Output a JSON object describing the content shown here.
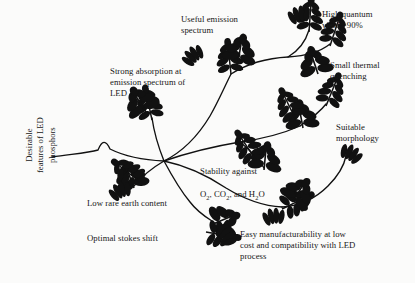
{
  "figure": {
    "title": "Desirable features of LED phosphors",
    "background_color": "#fbfbfa",
    "ink_color": "#111111",
    "axis_label": "Desirable\nfeatures of LED\nphosphors",
    "labels": [
      {
        "id": "useful-emission-spectrum",
        "text": "Useful emission\nspectrum",
        "x": 181,
        "y": 14
      },
      {
        "id": "high-quantum-yield",
        "text": "High quantum\nyield >90%",
        "x": 322,
        "y": 9
      },
      {
        "id": "small-thermal-quenching",
        "text": "Small thermal\nquenching",
        "x": 330,
        "y": 60
      },
      {
        "id": "strong-absorption",
        "text": "Strong absorption at\nemission spectrum of\nLED",
        "x": 110,
        "y": 66
      },
      {
        "id": "suitable-morphology",
        "text": "Suitable\nmorphology",
        "x": 336,
        "y": 122
      },
      {
        "id": "stability-against",
        "text": "Stability against",
        "x": 200,
        "y": 155
      },
      {
        "id": "low-rare-earth-content",
        "text": "Low rare earth content",
        "x": 87,
        "y": 198
      },
      {
        "id": "optimal-stokes-shift",
        "text": "Optimal stokes shift",
        "x": 87,
        "y": 233
      },
      {
        "id": "easy-manufacturability",
        "text": "Easy manufacturability at low\ncost and compatibility with LED\nprocess",
        "x": 240,
        "y": 229
      }
    ],
    "stability_formula": {
      "prefix": "O",
      "s1": "2",
      "mid": ", CO",
      "s2": "2",
      "mid2": ", and H",
      "s3": "2",
      "suffix": "O"
    }
  }
}
